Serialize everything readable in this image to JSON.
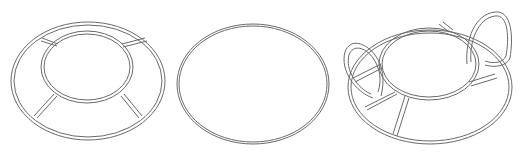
{
  "figures": [
    {
      "name": "ring-trivet-with-spokes",
      "description": "Outer ring with inner ring joined by four spokes"
    },
    {
      "name": "plain-ring",
      "description": "Single oval ring"
    },
    {
      "name": "ring-trivet-with-handles",
      "description": "Ring with inner ring, spokes, and two loop handles"
    }
  ],
  "colors": {
    "stroke": "#6a6a6a",
    "background": "#ffffff"
  }
}
